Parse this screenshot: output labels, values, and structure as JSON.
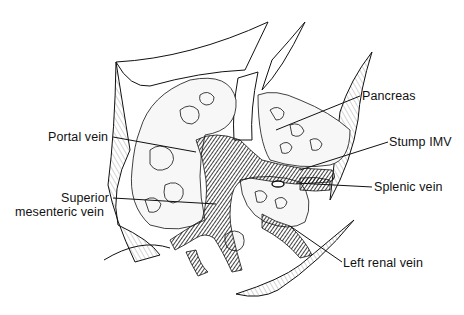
{
  "figure": {
    "type": "surgical anatomical illustration",
    "colors": {
      "ink": "#111111",
      "background": "#ffffff",
      "vein_fill": "#1a1a1a",
      "tissue": "#f4f4f4"
    },
    "labels": [
      {
        "id": "pancreas",
        "text": "Pancreas",
        "x": 362,
        "y": 89,
        "line": [
          360,
          96,
          276,
          130
        ]
      },
      {
        "id": "portal-vein",
        "text": "Portal vein",
        "x": 48,
        "y": 130,
        "line": [
          113,
          137,
          196,
          152
        ]
      },
      {
        "id": "stump-imv",
        "text": "Stump IMV",
        "x": 389,
        "y": 135,
        "line": [
          388,
          142,
          300,
          170
        ]
      },
      {
        "id": "superior-mesenteric-vein-line1",
        "text": "Superior",
        "x": 61,
        "y": 191,
        "line": [
          113,
          198,
          216,
          204
        ]
      },
      {
        "id": "superior-mesenteric-vein-line2",
        "text": "mesenteric vein",
        "x": 15,
        "y": 205
      },
      {
        "id": "splenic-vein",
        "text": "Splenic vein",
        "x": 374,
        "y": 180,
        "line": [
          372,
          187,
          296,
          183
        ]
      },
      {
        "id": "left-renal-vein",
        "text": "Left renal vein",
        "x": 343,
        "y": 256,
        "line": [
          342,
          262,
          290,
          226
        ]
      }
    ]
  }
}
